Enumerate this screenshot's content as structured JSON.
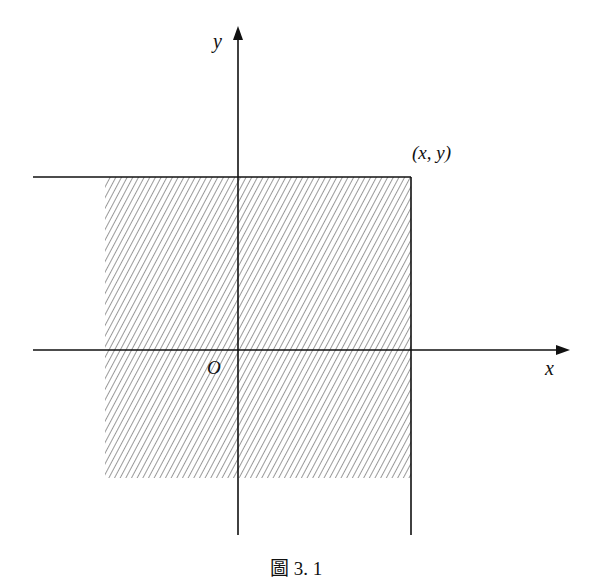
{
  "figure": {
    "caption": "圖 3. 1",
    "labels": {
      "y_axis": "y",
      "x_axis": "x",
      "origin": "O",
      "point": "(x, y)"
    },
    "colors": {
      "line": "#111111",
      "hatch": "#555555",
      "background": "#ffffff"
    },
    "geometry": {
      "origin_px": [
        238,
        350
      ],
      "point_px": [
        411,
        177
      ],
      "hatched_region_px": {
        "x0": 105,
        "y0": 177,
        "x1": 411,
        "y1": 478
      }
    }
  }
}
